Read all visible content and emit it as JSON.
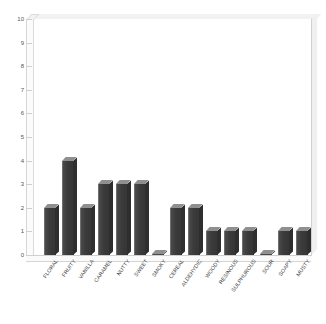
{
  "chart_data": {
    "type": "bar",
    "title": "",
    "subtitle": "",
    "xlabel": "",
    "ylabel": "",
    "ylim": [
      0,
      10
    ],
    "yticks": [
      0,
      1,
      2,
      3,
      4,
      5,
      6,
      7,
      8,
      9,
      10
    ],
    "ytick_labels": [
      "0",
      "1",
      "2",
      "3",
      "4",
      "5",
      "6",
      "7",
      "8",
      "9",
      "10"
    ],
    "grid": false,
    "legend": false,
    "legend_position": "none",
    "style": "3d-column",
    "bar_color": "#414141",
    "categories": [
      "FLORAL",
      "FRUITY",
      "VANILLA",
      "CARAMEL",
      "NUTTY",
      "SWEET",
      "SMOKY",
      "CEREAL",
      "ALDEHYDIC",
      "WOODY",
      "RESINOUS",
      "SULPHUROUS",
      "SOUR",
      "SOAPY",
      "MUSTY"
    ],
    "values": [
      2,
      4,
      2,
      3,
      3,
      3,
      0,
      2,
      2,
      1,
      1,
      1,
      0,
      1,
      1
    ]
  }
}
